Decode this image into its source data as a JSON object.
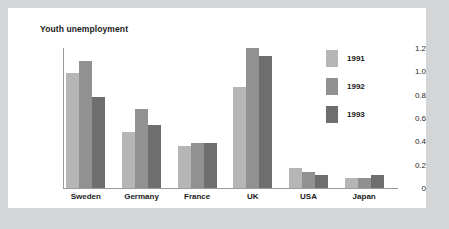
{
  "card": {
    "background_color": "#ffffff",
    "frame_color": "#d3d5d7"
  },
  "chart_data": {
    "type": "bar",
    "title": "Youth unemployment",
    "xlabel": "",
    "ylabel": "",
    "ylim": [
      0,
      1.2
    ],
    "grid": false,
    "legend_position": "right",
    "categories": [
      "Sweden",
      "Germany",
      "France",
      "UK",
      "USA",
      "Japan"
    ],
    "y_ticks": [
      "0",
      "0.2",
      "0.4",
      "0.6",
      "0.8",
      "1.0",
      "1.2"
    ],
    "y_tick_values": [
      0,
      0.2,
      0.4,
      0.6,
      0.8,
      1.0,
      1.2
    ],
    "series": [
      {
        "name": "1991",
        "color": "#b6b6b6",
        "values": [
          0.99,
          0.48,
          0.36,
          0.87,
          0.17,
          0.09
        ]
      },
      {
        "name": "1992",
        "color": "#919191",
        "values": [
          1.09,
          0.68,
          0.39,
          1.2,
          0.14,
          0.09
        ]
      },
      {
        "name": "1993",
        "color": "#6e6e6e",
        "values": [
          0.78,
          0.54,
          0.39,
          1.13,
          0.11,
          0.11
        ]
      }
    ]
  }
}
